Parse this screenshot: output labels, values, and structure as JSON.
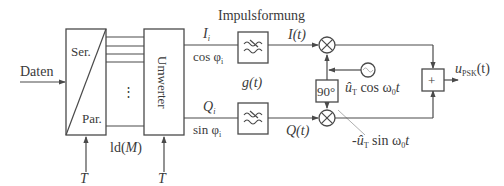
{
  "diagram": {
    "input": {
      "label": "Daten"
    },
    "serial_parallel": {
      "top_label": "Ser.",
      "bottom_label": "Par.",
      "clock": "T"
    },
    "bus": {
      "dots": "⋮",
      "width_label_pre": "ld(",
      "width_label_var": "M",
      "width_label_post": ")"
    },
    "mapper": {
      "label": "Umwerter",
      "clock": "T"
    },
    "i_branch": {
      "symbol": "I",
      "symbol_sub": "i",
      "value_pre": "cos φ",
      "value_sub": "i",
      "filter_output": "I(t)"
    },
    "q_branch": {
      "symbol": "Q",
      "symbol_sub": "i",
      "value_pre": "sin φ",
      "value_sub": "i",
      "filter_output": "Q(t)"
    },
    "pulse_shaping": {
      "title": "Impulsformung",
      "impulse_response": "g(t)"
    },
    "oscillator": {
      "carrier_cos_pre": "û",
      "carrier_cos_sub": "T",
      "carrier_cos_post": " cos ω",
      "carrier_cos_sub2": "0",
      "carrier_cos_end": "t",
      "carrier_sin_pre": "-û",
      "carrier_sin_sub": "T",
      "carrier_sin_post": " sin ω",
      "carrier_sin_sub2": "0",
      "carrier_sin_end": "t"
    },
    "phase_shifter": {
      "label": "90°"
    },
    "summer": {
      "symbol": "+"
    },
    "output": {
      "label_pre": "u",
      "label_sub": "PSK",
      "label_post": "(t)"
    },
    "colors": {
      "line": "#4a4a4a",
      "text": "#3a3a3a",
      "background": "#ffffff"
    }
  }
}
